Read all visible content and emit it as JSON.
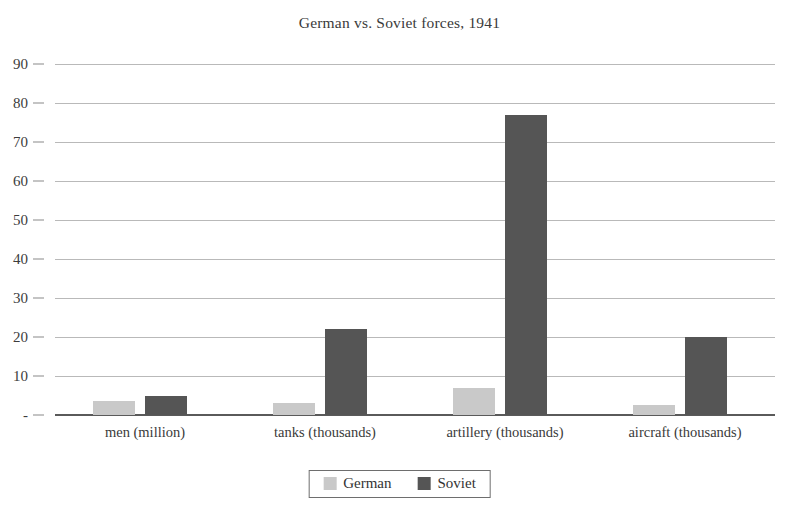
{
  "chart_data": {
    "type": "bar",
    "title": "German vs. Soviet forces, 1941",
    "xlabel": "",
    "ylabel": "",
    "ylim": [
      0,
      90
    ],
    "ytick_step": 10,
    "grid": true,
    "legend_position": "bottom",
    "zero_tick_label": "-",
    "categories": [
      "men (million)",
      "tanks (thousands)",
      "artillery (thousands)",
      "aircraft (thousands)"
    ],
    "ytick_labels": [
      "90",
      "80",
      "70",
      "60",
      "50",
      "40",
      "30",
      "20",
      "10",
      "-"
    ],
    "ytick_values": [
      90,
      80,
      70,
      60,
      50,
      40,
      30,
      20,
      10,
      0
    ],
    "series": [
      {
        "name": "German",
        "color": "#c9c9c9",
        "values": [
          3.5,
          3.0,
          7.0,
          2.5
        ]
      },
      {
        "name": "Soviet",
        "color": "#555555",
        "values": [
          5.0,
          22.0,
          77.0,
          20.0
        ]
      }
    ]
  },
  "legend": {
    "entries": [
      {
        "label": "German",
        "color": "#c9c9c9",
        "swatch_name": "legend-swatch-german"
      },
      {
        "label": "Soviet",
        "color": "#555555",
        "swatch_name": "legend-swatch-soviet"
      }
    ]
  }
}
